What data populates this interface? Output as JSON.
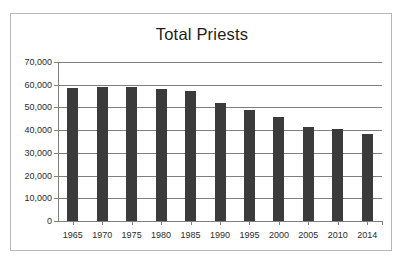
{
  "chart_data": {
    "type": "bar",
    "title": "Total Priests",
    "xlabel": "",
    "ylabel": "",
    "categories": [
      "1965",
      "1970",
      "1975",
      "1980",
      "1985",
      "1990",
      "1995",
      "2000",
      "2005",
      "2010",
      "2014"
    ],
    "values": [
      58600,
      59200,
      59200,
      58100,
      57300,
      52000,
      49000,
      45700,
      41400,
      40600,
      38300
    ],
    "ylim": [
      0,
      70000
    ],
    "ytick_values": [
      0,
      10000,
      20000,
      30000,
      40000,
      50000,
      60000,
      70000
    ],
    "ytick_labels": [
      "0",
      "10,000",
      "20,000",
      "30,000",
      "40,000",
      "50,000",
      "60,000",
      "70,000"
    ],
    "grid": true,
    "legend": false,
    "bar_color": "#3b3b3b",
    "gridline_color": "#7f7f7f",
    "frame_color": "#b9b9b9",
    "background_color": "#ffffff"
  }
}
